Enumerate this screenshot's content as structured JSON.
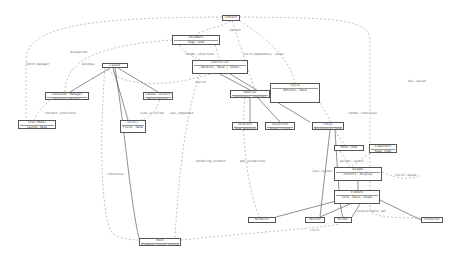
{
  "diagram": {
    "type": "class-dependency-graph",
    "nodes": [
      {
        "id": "n_top",
        "label": "Context",
        "x": 222,
        "y": 15,
        "w": 18,
        "h": 6
      },
      {
        "id": "n_a",
        "label": "Document",
        "sub": "Page item",
        "x": 172,
        "y": 35,
        "w": 48,
        "h": 10
      },
      {
        "id": "n_b",
        "label": "Controller",
        "sub": "Handler, Base | State",
        "x": 192,
        "y": 60,
        "w": 56,
        "h": 14
      },
      {
        "id": "n_c",
        "label": "Layout",
        "x": 102,
        "y": 63,
        "w": 26,
        "h": 5
      },
      {
        "id": "n_d",
        "label": "Container Manager",
        "sub": "Display object",
        "x": 45,
        "y": 92,
        "w": 44,
        "h": 8
      },
      {
        "id": "n_e",
        "label": "Canvas Context",
        "sub": "Base object",
        "x": 143,
        "y": 92,
        "w": 30,
        "h": 8
      },
      {
        "id": "n_f",
        "label": "View Model",
        "sub": "Layout data",
        "x": 18,
        "y": 120,
        "w": 38,
        "h": 9
      },
      {
        "id": "n_g",
        "label": "Scroll",
        "sub": "Field, Data",
        "x": 120,
        "y": 120,
        "w": 26,
        "h": 13
      },
      {
        "id": "n_h",
        "label": "Handler",
        "sub": "Connector, Options",
        "x": 230,
        "y": 90,
        "w": 40,
        "h": 8
      },
      {
        "id": "n_i",
        "label": "Style",
        "sub": "Options, Base",
        "x": 270,
        "y": 83,
        "w": 50,
        "h": 20
      },
      {
        "id": "n_j",
        "label": "Selector",
        "sub": "Item Handler",
        "x": 232,
        "y": 122,
        "w": 26,
        "h": 8
      },
      {
        "id": "n_k",
        "label": "Selection",
        "sub": "Image layout",
        "x": 265,
        "y": 122,
        "w": 30,
        "h": 8
      },
      {
        "id": "n_l",
        "label": "Focus",
        "sub": "Navigation Item",
        "x": 312,
        "y": 122,
        "w": 32,
        "h": 8
      },
      {
        "id": "n_m",
        "label": "Menu Item",
        "x": 334,
        "y": 145,
        "w": 30,
        "h": 6
      },
      {
        "id": "n_n",
        "label": "Component",
        "sub": "Base item",
        "x": 369,
        "y": 144,
        "w": 28,
        "h": 9
      },
      {
        "id": "n_o",
        "label": "Widget",
        "sub": "Control, Display",
        "x": 334,
        "y": 167,
        "w": 48,
        "h": 14
      },
      {
        "id": "n_p",
        "label": "Element",
        "sub": "Core, Base, Shape",
        "x": 334,
        "y": 190,
        "w": 46,
        "h": 14
      },
      {
        "id": "n_q",
        "label": "Renderer",
        "x": 248,
        "y": 217,
        "w": 28,
        "h": 6
      },
      {
        "id": "n_r",
        "label": "Painter",
        "x": 305,
        "y": 217,
        "w": 20,
        "h": 6
      },
      {
        "id": "n_s",
        "label": "Border",
        "x": 334,
        "y": 217,
        "w": 18,
        "h": 6
      },
      {
        "id": "n_t",
        "label": "Container",
        "x": 421,
        "y": 217,
        "w": 22,
        "h": 6
      },
      {
        "id": "n_u",
        "label": "Root",
        "sub": "Element Layout object",
        "x": 139,
        "y": 238,
        "w": 42,
        "h": 8
      }
    ],
    "edge_labels": [
      {
        "text": "fetch_manager",
        "x": 26,
        "y": 62
      },
      {
        "text": "parent",
        "x": 230,
        "y": 28
      },
      {
        "text": "dispatcher",
        "x": 70,
        "y": 50
      },
      {
        "text": "Windows",
        "x": 82,
        "y": 62
      },
      {
        "text": "render_interface",
        "x": 185,
        "y": 52
      },
      {
        "text": "child_dependency",
        "x": 243,
        "y": 52
      },
      {
        "text": "owner",
        "x": 275,
        "y": 52
      },
      {
        "text": "source",
        "x": 195,
        "y": 80
      },
      {
        "text": "context_interface",
        "x": 45,
        "y": 111
      },
      {
        "text": "size_scrolled",
        "x": 140,
        "y": 111
      },
      {
        "text": "sub_component",
        "x": 170,
        "y": 111
      },
      {
        "text": "reference",
        "x": 107,
        "y": 172
      },
      {
        "text": "rendering_context",
        "x": 195,
        "y": 159
      },
      {
        "text": "pen_properties",
        "x": 240,
        "y": 159
      },
      {
        "text": "render_interface",
        "x": 348,
        "y": 111
      },
      {
        "text": "last_layout",
        "x": 312,
        "y": 169
      },
      {
        "text": "parent_layout",
        "x": 340,
        "y": 159
      },
      {
        "text": "has_layout",
        "x": 408,
        "y": 79
      },
      {
        "text": "child_layout",
        "x": 395,
        "y": 173
      },
      {
        "text": "interactable_set",
        "x": 357,
        "y": 209
      },
      {
        "text": "child",
        "x": 310,
        "y": 228
      }
    ]
  }
}
